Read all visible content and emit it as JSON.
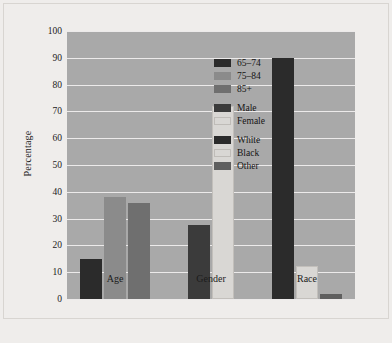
{
  "chart_data": {
    "type": "bar",
    "title": "",
    "subtitle": "",
    "xlabel": "",
    "ylabel": "Percentage",
    "ylim": [
      0,
      100
    ],
    "ytick_step": 10,
    "yticks": [
      "0",
      "10",
      "20",
      "30",
      "40",
      "50",
      "60",
      "70",
      "80",
      "90",
      "100"
    ],
    "categories": [
      "Age",
      "Gender",
      "Race"
    ],
    "grid": true,
    "legend_position": "inside-right",
    "plot_background": "#a9a9a9",
    "gridline_color": "#eceaea",
    "groups": [
      {
        "category": "Age",
        "bars": [
          {
            "label": "65–74",
            "value": 15,
            "color": "#2b2b2b"
          },
          {
            "label": "75–84",
            "value": 38,
            "color": "#8b8b8b"
          },
          {
            "label": "85+",
            "value": 36,
            "color": "#6f6f6f"
          }
        ]
      },
      {
        "category": "Gender",
        "bars": [
          {
            "label": "Male",
            "value": 27.5,
            "color": "#3b3b3b"
          },
          {
            "label": "Female",
            "value": 72,
            "color": "#d9d7d4"
          }
        ]
      },
      {
        "category": "Race",
        "bars": [
          {
            "label": "White",
            "value": 90,
            "color": "#2b2b2b"
          },
          {
            "label": "Black",
            "value": 12.5,
            "color": "#d9d7d4"
          },
          {
            "label": "Other",
            "value": 2,
            "color": "#5f5f5f"
          }
        ]
      }
    ],
    "legend": [
      {
        "label": "65–74",
        "color": "#2b2b2b",
        "gap_before": false
      },
      {
        "label": "75–84",
        "color": "#8b8b8b",
        "gap_before": false
      },
      {
        "label": "85+",
        "color": "#6f6f6f",
        "gap_before": false
      },
      {
        "label": "Male",
        "color": "#3b3b3b",
        "gap_before": true
      },
      {
        "label": "Female",
        "color": "#d9d7d4",
        "gap_before": false
      },
      {
        "label": "White",
        "color": "#2b2b2b",
        "gap_before": true
      },
      {
        "label": "Black",
        "color": "#d9d7d4",
        "gap_before": false
      },
      {
        "label": "Other",
        "color": "#5f5f5f",
        "gap_before": false
      }
    ]
  }
}
